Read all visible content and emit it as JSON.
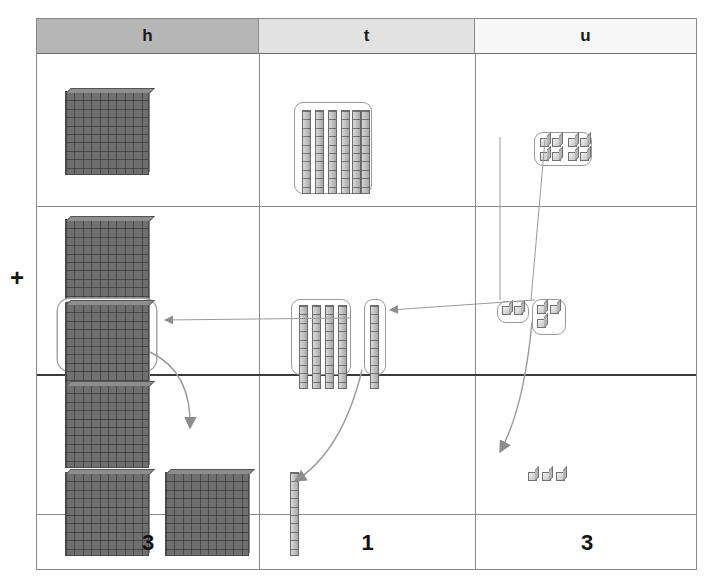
{
  "diagram": {
    "operator": "+",
    "columns": [
      {
        "key": "h",
        "label": "h",
        "name": "hundreds",
        "header_color": "#b6b6b6"
      },
      {
        "key": "t",
        "label": "t",
        "name": "tens",
        "header_color": "#e2e2e2"
      },
      {
        "key": "u",
        "label": "u",
        "name": "units",
        "header_color": "#f7f7f7"
      }
    ],
    "rows": [
      {
        "name": "addend-1",
        "hundreds_flats": 1,
        "tens_rods": 6,
        "tens_grouped": true,
        "unit_cubes": 8,
        "units_grouped": true
      },
      {
        "name": "addend-2",
        "hundreds_flats": 2,
        "hundreds_regrouped_box": 1,
        "tens_rods": 4,
        "tens_grouped": true,
        "tens_carried_rod": 1,
        "unit_cubes": 2,
        "units_grouped": true,
        "units_carry_group": 3
      },
      {
        "name": "sum",
        "hundreds_flats": 3,
        "hundreds_carried": 1,
        "tens_rods": 1,
        "unit_cubes": 3
      }
    ],
    "result": {
      "name": "answer-row",
      "hundreds_digit": "3",
      "tens_digit": "1",
      "units_digit": "3",
      "number": "313"
    },
    "annotations": {
      "arrow_units_to_tens": "regroup ten units into one ten",
      "arrow_tens_to_hundreds": "regroup ten tens into one hundred",
      "arrow_carry_hundred": "carried hundred flat",
      "arrow_carry_ten": "carried ten rod",
      "arrow_carry_units": "remaining units"
    },
    "colors": {
      "flat_fill": "#6f6f6f",
      "rod_fill": "#c0c0c0",
      "cube_fill": "#dcdcdc",
      "grid_line": "#8a8a8a",
      "arrow": "#8d8d8d",
      "text": "#111111"
    }
  }
}
